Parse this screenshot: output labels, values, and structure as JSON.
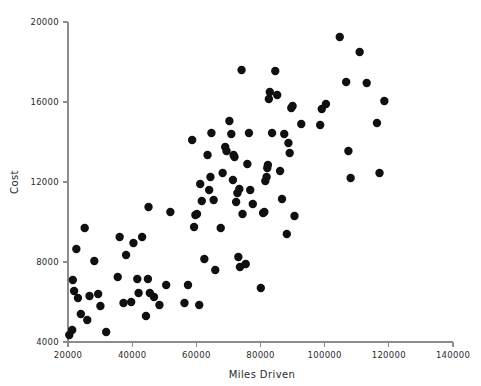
{
  "chart_data": {
    "type": "scatter",
    "title": "",
    "xlabel": "Miles Driven",
    "ylabel": "Cost",
    "xlim": [
      20000,
      140000
    ],
    "ylim": [
      4000,
      20000
    ],
    "xticks": [
      20000,
      40000,
      60000,
      80000,
      100000,
      120000,
      140000
    ],
    "yticks": [
      4000,
      8000,
      12000,
      16000,
      20000
    ],
    "xtick_labels": [
      "20000",
      "40000",
      "60000",
      "80000",
      "100000",
      "120000",
      "140000"
    ],
    "ytick_labels": [
      "4000",
      "8000",
      "12000",
      "16000",
      "20000"
    ],
    "grid": false,
    "legend": false,
    "marker": {
      "shape": "circle",
      "color": "#101010",
      "radius_px": 4.2
    },
    "series": [
      {
        "name": "Vehicles",
        "points": [
          [
            20400,
            4350
          ],
          [
            21300,
            4600
          ],
          [
            21500,
            7100
          ],
          [
            21900,
            6550
          ],
          [
            22600,
            8650
          ],
          [
            23100,
            6200
          ],
          [
            24000,
            5400
          ],
          [
            25200,
            9700
          ],
          [
            26000,
            5100
          ],
          [
            26700,
            6300
          ],
          [
            28200,
            8050
          ],
          [
            29400,
            6400
          ],
          [
            30100,
            5800
          ],
          [
            31900,
            4500
          ],
          [
            35500,
            7250
          ],
          [
            36100,
            9250
          ],
          [
            37300,
            5950
          ],
          [
            38100,
            8350
          ],
          [
            39700,
            6000
          ],
          [
            40400,
            8950
          ],
          [
            41600,
            7150
          ],
          [
            42000,
            6450
          ],
          [
            43100,
            9250
          ],
          [
            44300,
            5300
          ],
          [
            44900,
            7150
          ],
          [
            45100,
            10750
          ],
          [
            45500,
            6450
          ],
          [
            46800,
            6250
          ],
          [
            48500,
            5850
          ],
          [
            50600,
            6850
          ],
          [
            51900,
            10500
          ],
          [
            56300,
            5950
          ],
          [
            57400,
            6850
          ],
          [
            58700,
            14100
          ],
          [
            59300,
            9750
          ],
          [
            59700,
            10350
          ],
          [
            60200,
            10400
          ],
          [
            60900,
            5850
          ],
          [
            61200,
            11900
          ],
          [
            61700,
            11050
          ],
          [
            62500,
            8150
          ],
          [
            63500,
            13350
          ],
          [
            64000,
            11600
          ],
          [
            64400,
            12250
          ],
          [
            64700,
            14450
          ],
          [
            65400,
            11100
          ],
          [
            65900,
            7600
          ],
          [
            67600,
            9700
          ],
          [
            68200,
            12450
          ],
          [
            69000,
            13750
          ],
          [
            69400,
            13550
          ],
          [
            70300,
            15050
          ],
          [
            70900,
            14400
          ],
          [
            71400,
            12100
          ],
          [
            71600,
            13350
          ],
          [
            71900,
            13250
          ],
          [
            72400,
            11000
          ],
          [
            72800,
            11450
          ],
          [
            73100,
            8250
          ],
          [
            73400,
            11650
          ],
          [
            73600,
            7750
          ],
          [
            74100,
            17600
          ],
          [
            74400,
            10400
          ],
          [
            75400,
            7900
          ],
          [
            75900,
            12900
          ],
          [
            76400,
            14450
          ],
          [
            76800,
            11600
          ],
          [
            77600,
            10900
          ],
          [
            80100,
            6700
          ],
          [
            80800,
            10450
          ],
          [
            81200,
            10500
          ],
          [
            81500,
            12050
          ],
          [
            81900,
            12250
          ],
          [
            82100,
            12700
          ],
          [
            82300,
            12850
          ],
          [
            82600,
            16150
          ],
          [
            82900,
            16500
          ],
          [
            83600,
            14450
          ],
          [
            84600,
            17550
          ],
          [
            85200,
            16350
          ],
          [
            86100,
            12550
          ],
          [
            86700,
            11150
          ],
          [
            87400,
            14400
          ],
          [
            88200,
            9400
          ],
          [
            88700,
            13950
          ],
          [
            89100,
            13450
          ],
          [
            89600,
            15700
          ],
          [
            90000,
            15800
          ],
          [
            90600,
            10300
          ],
          [
            92700,
            14900
          ],
          [
            98600,
            14850
          ],
          [
            99100,
            15650
          ],
          [
            100400,
            15900
          ],
          [
            104700,
            19250
          ],
          [
            106700,
            17000
          ],
          [
            107400,
            13550
          ],
          [
            108100,
            12200
          ],
          [
            110900,
            18500
          ],
          [
            113100,
            16950
          ],
          [
            116300,
            14950
          ],
          [
            117100,
            12450
          ],
          [
            118600,
            16050
          ]
        ]
      }
    ]
  },
  "axes": {
    "x_label": "Miles Driven",
    "y_label": "Cost"
  }
}
